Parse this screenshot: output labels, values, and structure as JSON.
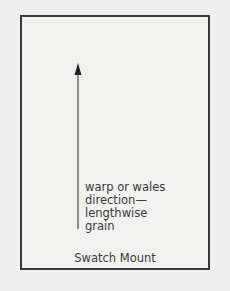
{
  "diagram": {
    "title": "Swatch Mount",
    "arrow_label": [
      "warp or wales",
      "direction—",
      "lengthwise",
      "grain"
    ],
    "arrow_direction": "up",
    "colors": {
      "border": "#3a3a3a",
      "background": "#efefef",
      "text": "#3a3a3a"
    }
  }
}
